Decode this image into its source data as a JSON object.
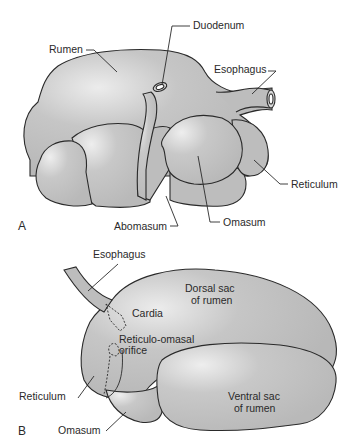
{
  "figure": {
    "colors": {
      "organ_fill": "#bdbdbd",
      "organ_highlight": "#e6e6e6",
      "outline": "#2a2a2a",
      "background": "#ffffff"
    },
    "panel_a": {
      "panel_label": "A",
      "labels": {
        "rumen": "Rumen",
        "duodenum": "Duodenum",
        "esophagus": "Esophagus",
        "reticulum": "Reticulum",
        "omasum": "Omasum",
        "abomasum": "Abomasum"
      }
    },
    "panel_b": {
      "panel_label": "B",
      "labels": {
        "esophagus": "Esophagus",
        "cardia": "Cardia",
        "dorsal_sac_line1": "Dorsal sac",
        "dorsal_sac_line2": "of rumen",
        "reticulo_omasal_line1": "Reticulo-omasal",
        "reticulo_omasal_line2": "orifice",
        "reticulum": "Reticulum",
        "ventral_sac_line1": "Ventral sac",
        "ventral_sac_line2": "of rumen",
        "omasum": "Omasum"
      }
    }
  }
}
